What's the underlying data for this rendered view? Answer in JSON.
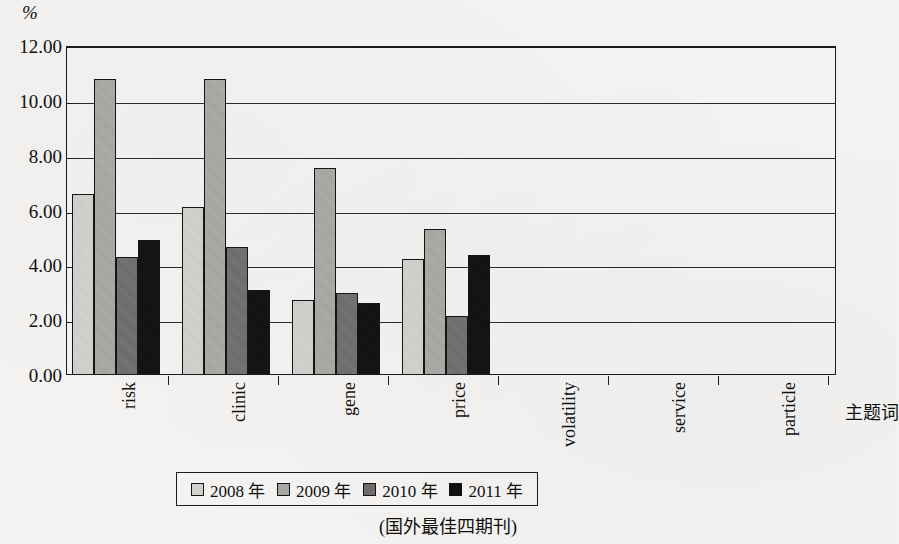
{
  "chart_data": {
    "type": "bar",
    "title": "",
    "caption": "(国外最佳四期刊)",
    "xlabel": "主题词",
    "ylabel": "%",
    "ylim": [
      0,
      12
    ],
    "yticks": [
      "0.00",
      "2.00",
      "4.00",
      "6.00",
      "8.00",
      "10.00",
      "12.00"
    ],
    "ytick_values": [
      0,
      2,
      4,
      6,
      8,
      10,
      12
    ],
    "grid": true,
    "grid_axis": "y",
    "legend_position": "bottom",
    "categories": [
      "risk",
      "clinic",
      "gene",
      "price",
      "volatility",
      "service",
      "particle"
    ],
    "series": [
      {
        "name": "2008 年",
        "color": "#d2d0cd",
        "values": [
          6.55,
          6.1,
          2.7,
          4.2,
          0,
          0,
          0
        ]
      },
      {
        "name": "2009 年",
        "color": "#a9a7a4",
        "values": [
          10.75,
          10.75,
          7.5,
          5.3,
          0,
          0,
          0
        ]
      },
      {
        "name": "2010 年",
        "color": "#6e6d6b",
        "values": [
          4.25,
          4.65,
          2.95,
          2.1,
          0,
          0,
          0
        ]
      },
      {
        "name": "2011 年",
        "color": "#111111",
        "values": [
          4.9,
          3.05,
          2.6,
          4.35,
          0,
          0,
          0
        ]
      }
    ]
  },
  "figure": {
    "unit_label": "%",
    "xaxis_title": "主题词",
    "caption": "(国外最佳四期刊)"
  }
}
